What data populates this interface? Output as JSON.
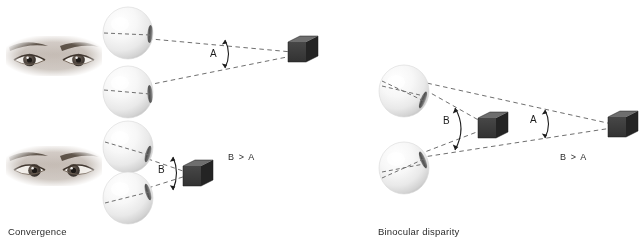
{
  "figure": {
    "background_color": "#ffffff",
    "width": 642,
    "height": 244
  },
  "panels": [
    {
      "id": "convergence",
      "caption": "Convergence",
      "inequality": "B > A",
      "description": "Two rows of eyeball spheres fixating a cube at far and near distance; the convergence angle is larger for the nearer cube.",
      "rows": [
        {
          "id": "far-fixation",
          "angle_label": "A",
          "eye_count": 2,
          "target": "cube",
          "target_distance": "far"
        },
        {
          "id": "near-fixation",
          "angle_label": "B",
          "eye_count": 2,
          "target": "cube",
          "target_distance": "near"
        }
      ],
      "eye_photos": [
        {
          "id": "eyes-relaxed",
          "alt": "photograph of a pair of human eyes gazing straight ahead"
        },
        {
          "id": "eyes-converged",
          "alt": "photograph of a pair of human eyes converged inward"
        }
      ]
    },
    {
      "id": "binocular-disparity",
      "caption": "Binocular disparity",
      "inequality": "B > A",
      "description": "A single pair of eyeball spheres views a near cube and a far cube; the near cube subtends a larger angle than the far cube.",
      "angles": [
        {
          "label": "B",
          "target": "near-cube"
        },
        {
          "label": "A",
          "target": "far-cube"
        }
      ]
    }
  ],
  "labels": {
    "angle_a_top": "A",
    "angle_b_bottom": "B",
    "angle_b_right": "B",
    "angle_a_right": "A",
    "inequality_left": "B > A",
    "inequality_right": "B > A",
    "caption_left": "Convergence",
    "caption_right": "Binocular disparity"
  },
  "colors": {
    "background": "#ffffff",
    "text": "#2b2b2b",
    "dashed_line": "#6f6f6f",
    "cube_front": "#3b3b3b",
    "cube_top": "#6a6a6a",
    "cube_side": "#2a2a2a",
    "sphere_light": "#ffffff",
    "sphere_mid": "#efefef",
    "sphere_shadow": "#c9c9c9",
    "lens": "#595959"
  }
}
